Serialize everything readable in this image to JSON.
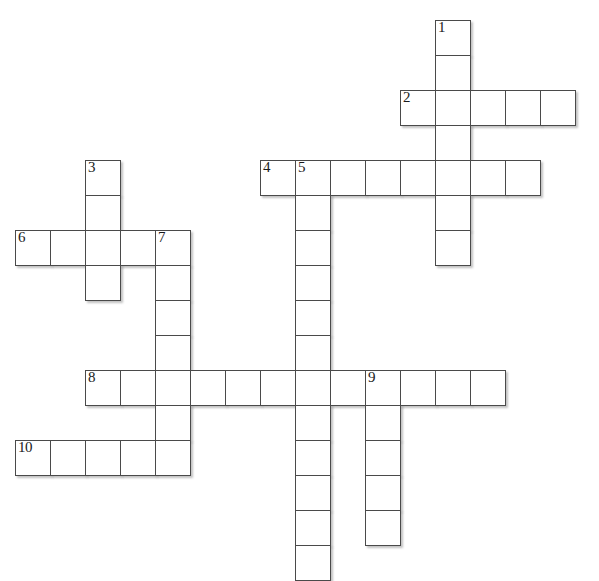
{
  "puzzle": {
    "title": "Crossword Grid",
    "cell_size": 35,
    "origin_x": 15,
    "origin_y": 20,
    "columns": 17,
    "rows": 16,
    "background_color": "#ffffff",
    "cell_fill": "#ffffff",
    "cell_border_color": "#4a4a4a",
    "number_color": "#1a1a1a",
    "shadow_color": "#787878"
  },
  "entries": [
    {
      "number": "1",
      "direction": "down",
      "start_col": 12,
      "start_row": 0,
      "length": 7
    },
    {
      "number": "2",
      "direction": "across",
      "start_col": 11,
      "start_row": 2,
      "length": 5
    },
    {
      "number": "3",
      "direction": "down",
      "start_col": 2,
      "start_row": 4,
      "length": 4
    },
    {
      "number": "4",
      "direction": "across",
      "start_col": 7,
      "start_row": 4,
      "length": 8
    },
    {
      "number": "5",
      "direction": "down",
      "start_col": 8,
      "start_row": 4,
      "length": 12
    },
    {
      "number": "6",
      "direction": "across",
      "start_col": 0,
      "start_row": 6,
      "length": 5
    },
    {
      "number": "7",
      "direction": "down",
      "start_col": 4,
      "start_row": 6,
      "length": 7
    },
    {
      "number": "8",
      "direction": "across",
      "start_col": 2,
      "start_row": 10,
      "length": 12
    },
    {
      "number": "9",
      "direction": "down",
      "start_col": 10,
      "start_row": 10,
      "length": 5
    },
    {
      "number": "10",
      "direction": "across",
      "start_col": 0,
      "start_row": 12,
      "length": 5
    }
  ],
  "numbered_cells": [
    {
      "number": "1",
      "col": 12,
      "row": 0
    },
    {
      "number": "2",
      "col": 11,
      "row": 2
    },
    {
      "number": "3",
      "col": 2,
      "row": 4
    },
    {
      "number": "4",
      "col": 7,
      "row": 4
    },
    {
      "number": "5",
      "col": 8,
      "row": 4
    },
    {
      "number": "6",
      "col": 0,
      "row": 6
    },
    {
      "number": "7",
      "col": 4,
      "row": 6
    },
    {
      "number": "8",
      "col": 2,
      "row": 10
    },
    {
      "number": "9",
      "col": 10,
      "row": 10
    },
    {
      "number": "10",
      "col": 0,
      "row": 12
    }
  ]
}
